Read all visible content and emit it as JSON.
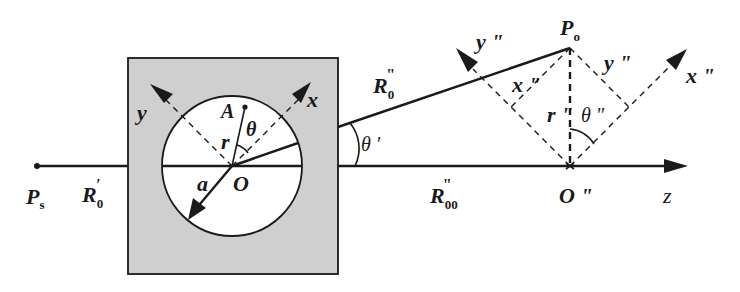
{
  "figure": {
    "colors": {
      "medium_fill": "#cfcfcf",
      "aperture_fill": "#ffffff",
      "ink": "#1a1a1a"
    }
  },
  "labels": {
    "source_point": {
      "main": "P",
      "sub": "s"
    },
    "source_distance": {
      "main": "R",
      "sub": "0",
      "sup": "′"
    },
    "origin": "O",
    "point_a": "A",
    "radius_a": "a",
    "radius_r": "r",
    "angle_theta": "θ",
    "axis_x": "x",
    "axis_y": "y",
    "angle_theta_prime": "θ ′",
    "observation_distance": {
      "main": "R",
      "sub": "0",
      "sup": "\""
    },
    "axial_distance": {
      "main": "R",
      "sub": "00",
      "sup": "\""
    },
    "observation_point": {
      "main": "P",
      "sub": "o"
    },
    "origin_double_prime": "O \"",
    "axis_z": "z",
    "axis_x_dp": "x \"",
    "axis_y_dp_left": "y \"",
    "axis_y_dp_right": "y \"",
    "proj_x_dp": "x \"",
    "radius_r_dp": "r \"",
    "angle_theta_dp": "θ \""
  }
}
